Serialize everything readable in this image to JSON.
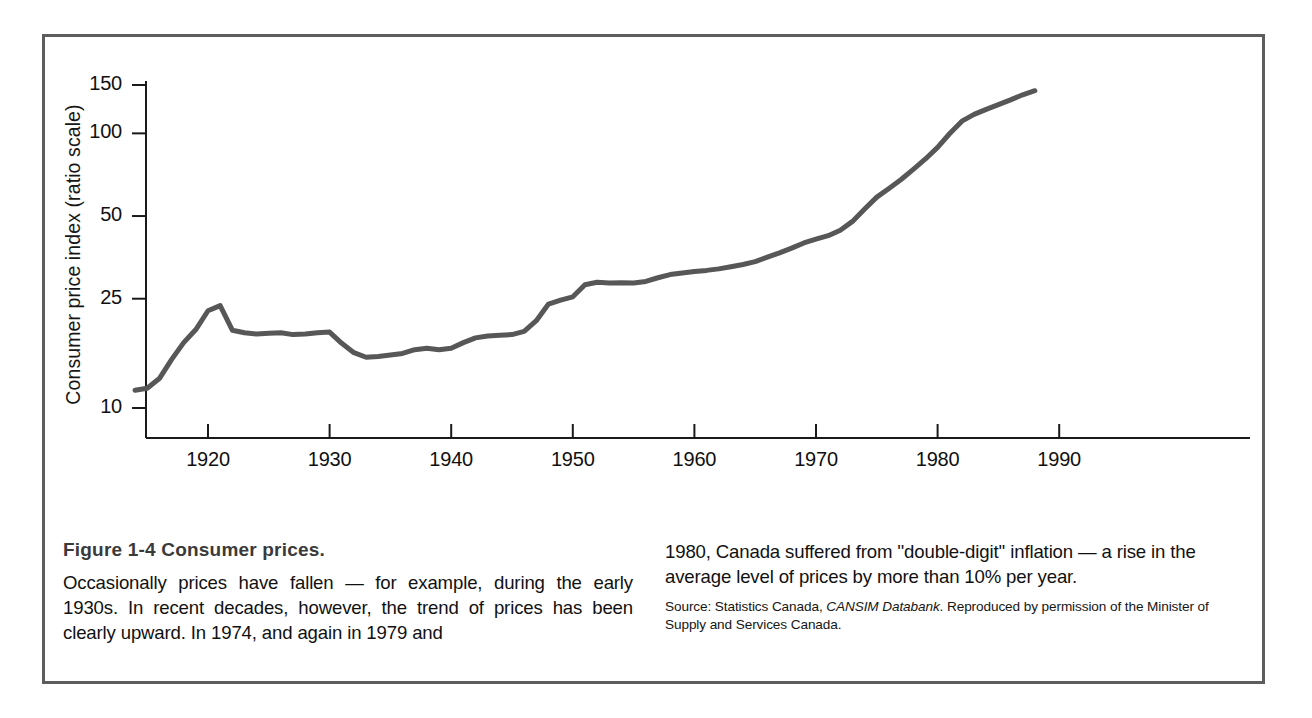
{
  "figure": {
    "title": "Figure 1-4   Consumer prices.",
    "caption_left": "Occasionally prices have fallen — for example, during the early 1930s. In recent decades, however, the trend of prices has been clearly upward. In 1974, and again in 1979 and",
    "caption_right": "1980, Canada suffered from ''double-digit'' inflation — a rise in the average level of prices by more than 10% per year.",
    "source_prefix": "Source: Statistics Canada, ",
    "source_italic": "CANSIM Databank",
    "source_suffix": ". Reproduced by permission of the Minister of Supply and Services Canada.",
    "frame_color": "#5d5d5d",
    "line_color": "#575757",
    "axis_color": "#1a1a1a"
  },
  "chart_data": {
    "type": "line",
    "title": "Consumer prices",
    "xlabel": "",
    "ylabel": "Consumer price index (ratio scale)",
    "yscale": "log",
    "grid": false,
    "legend": "none",
    "xlim": [
      1913,
      1992
    ],
    "ylim": [
      8.5,
      160
    ],
    "xticks": [
      1920,
      1930,
      1940,
      1950,
      1960,
      1970,
      1980,
      1990
    ],
    "xticklabels": [
      "1920",
      "1930",
      "1940",
      "1950",
      "1960",
      "1970",
      "1980",
      "1990"
    ],
    "yticks": [
      10,
      25,
      50,
      100,
      150
    ],
    "yticklabels": [
      "10",
      "25",
      "50",
      "100",
      "150"
    ],
    "series": [
      {
        "name": "Consumer price index",
        "x": [
          1914,
          1915,
          1916,
          1917,
          1918,
          1919,
          1920,
          1921,
          1922,
          1923,
          1924,
          1925,
          1926,
          1927,
          1928,
          1929,
          1930,
          1931,
          1932,
          1933,
          1934,
          1935,
          1936,
          1937,
          1938,
          1939,
          1940,
          1941,
          1942,
          1943,
          1944,
          1945,
          1946,
          1947,
          1948,
          1949,
          1950,
          1951,
          1952,
          1953,
          1954,
          1955,
          1956,
          1957,
          1958,
          1959,
          1960,
          1961,
          1962,
          1963,
          1964,
          1965,
          1966,
          1967,
          1968,
          1969,
          1970,
          1971,
          1972,
          1973,
          1974,
          1975,
          1976,
          1977,
          1978,
          1979,
          1980,
          1981,
          1982,
          1983,
          1984,
          1985,
          1986,
          1987,
          1988
        ],
        "values": [
          11.6,
          11.8,
          12.8,
          15.0,
          17.3,
          19.3,
          22.6,
          23.6,
          19.2,
          18.8,
          18.6,
          18.7,
          18.8,
          18.5,
          18.6,
          18.8,
          18.9,
          17.2,
          15.9,
          15.3,
          15.4,
          15.6,
          15.8,
          16.3,
          16.5,
          16.3,
          16.5,
          17.3,
          18.0,
          18.3,
          18.4,
          18.5,
          19.0,
          20.8,
          23.9,
          24.7,
          25.4,
          28.1,
          28.7,
          28.5,
          28.6,
          28.5,
          28.9,
          29.8,
          30.6,
          31.0,
          31.4,
          31.7,
          32.1,
          32.7,
          33.3,
          34.1,
          35.4,
          36.7,
          38.2,
          39.9,
          41.2,
          42.4,
          44.4,
          47.8,
          53.0,
          58.6,
          63.0,
          67.9,
          73.9,
          80.7,
          88.9,
          99.9,
          110.8,
          117.2,
          122.3,
          127.2,
          132.4,
          138.2,
          143.0
        ]
      }
    ],
    "annotations": []
  }
}
